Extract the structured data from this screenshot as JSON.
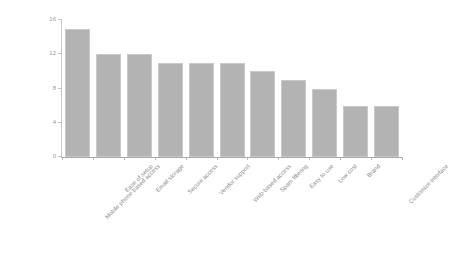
{
  "chart_data": {
    "type": "bar",
    "title": "",
    "subtitle": "",
    "xlabel": "",
    "ylabel": "",
    "ylim": [
      0,
      16
    ],
    "yticks": [
      0,
      4,
      8,
      12,
      16
    ],
    "grid": false,
    "legend": null,
    "bar_color": "#b3b3b3",
    "bar_edge_color": "#c9c9c9",
    "axis_color": "#a8a8a8",
    "background": "#ffffff",
    "categories": [
      "Mobile phone-based access",
      "Ease of setup",
      "Email storage",
      "Secure access",
      "Vendor support",
      "Web-based access",
      "Spam filtering",
      "Easy to use",
      "Low cost",
      "Brand",
      "Customize interface"
    ],
    "values": [
      15,
      12,
      12,
      11,
      11,
      11,
      10,
      9,
      8,
      6,
      6
    ]
  }
}
